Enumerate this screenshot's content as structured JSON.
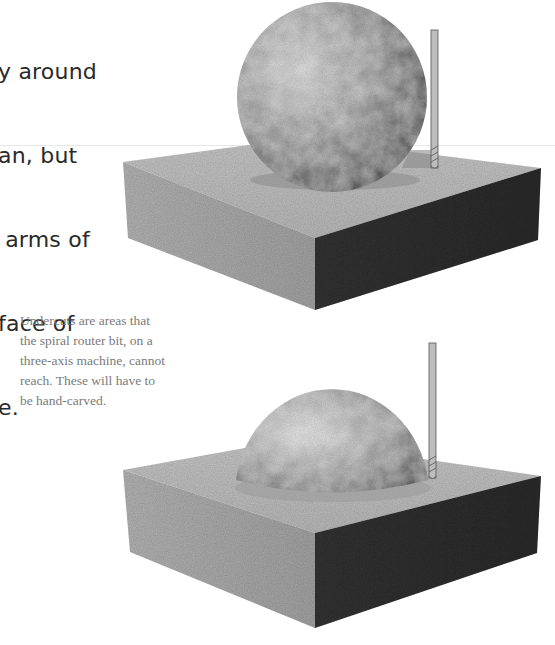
{
  "body_text": {
    "lines": [
      "y around",
      "an, but",
      " arms of",
      "face of",
      "e."
    ]
  },
  "caption": {
    "lines": [
      "Undercuts are areas that",
      "the spiral router bit, on a",
      "three-axis machine, cannot",
      "reach. These will have to",
      "be hand-carved."
    ]
  },
  "figures": [
    {
      "name": "sphere-on-block-full",
      "description": "Full sphere resting on rectangular block with spiral router bit beside it"
    },
    {
      "name": "sphere-on-block-undercut",
      "description": "Sphere partially sunk into block with spiral router bit showing undercut region"
    }
  ],
  "colors": {
    "body_text": "#2a2a2a",
    "caption_text": "#7a7a7a",
    "block_left_face": "#a9a9a9",
    "block_top_face": "#bdbdbd",
    "block_right_face": "#2e2e2e",
    "sphere": "#9a9a9a",
    "bit": "#b8b8b8"
  }
}
